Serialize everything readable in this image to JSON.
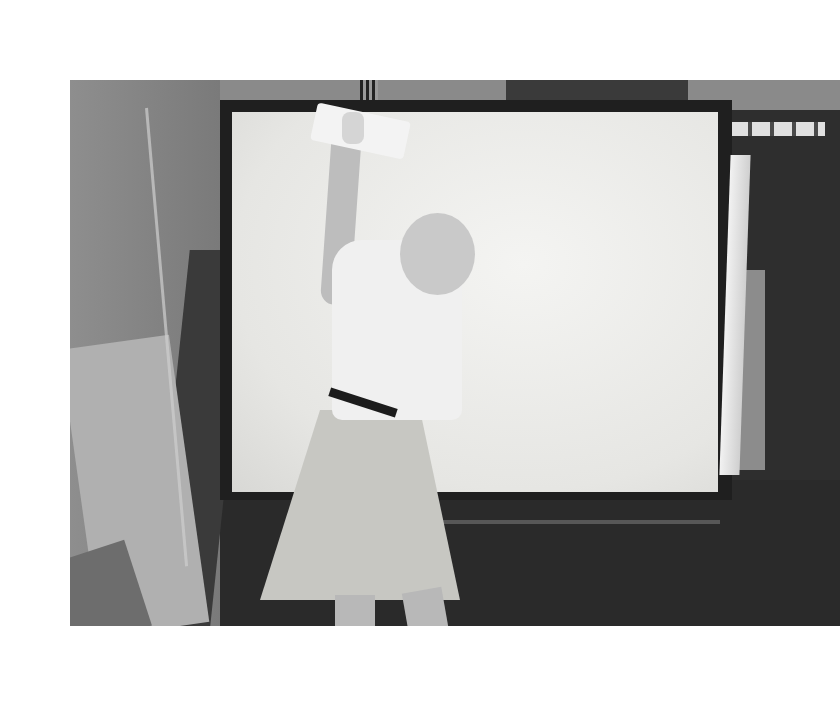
{
  "page": {
    "background": "#ffffff",
    "caption": ""
  },
  "photo": {
    "description": "Black-and-white photograph of a person in a white short-sleeved shirt and light skirt, seen from behind, reaching up with a cloth to wipe the top of a large white illuminated screen in a dark industrial workshop",
    "colors": {
      "screen": "#e8e8e5",
      "frame": "#1f1f1f",
      "floor": "#2a2a2a",
      "shirt": "#f0f0f0",
      "skirt": "#c7c7c2"
    },
    "faint_screen_text": "",
    "bounds": {
      "left": 70,
      "top": 80,
      "width": 770,
      "height": 546
    }
  }
}
